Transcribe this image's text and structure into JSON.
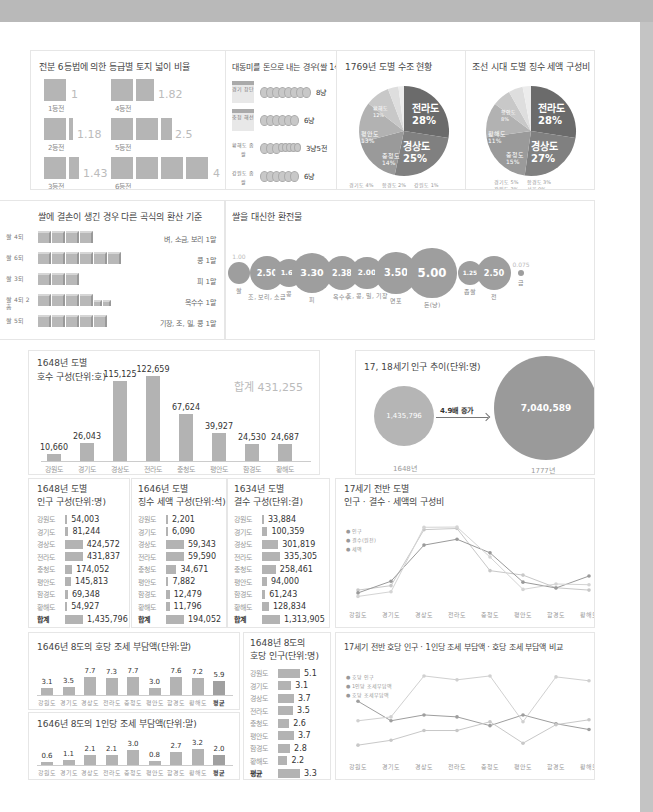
{
  "land_grades": {
    "title": "전분 6등법에 의한 등급별 토지 넓이 비율",
    "items": [
      {
        "label": "1등전",
        "value": "1"
      },
      {
        "label": "2등전",
        "value": "1.18"
      },
      {
        "label": "3등전",
        "value": "1.43"
      },
      {
        "label": "4등전",
        "value": "1.82"
      },
      {
        "label": "5등전",
        "value": "2.5"
      },
      {
        "label": "6등전",
        "value": "4"
      }
    ]
  },
  "daedong_money": {
    "title": "대동미를 돈으로 내는 경우(쌀 1석)",
    "items": [
      {
        "label": "경기 창단",
        "value": "8냥"
      },
      {
        "label": "충청 해선",
        "value": "6냥"
      },
      {
        "label": "황해도 좁쌀",
        "value": "3냥5전"
      },
      {
        "label": "강원도 좁쌀",
        "value": "6냥"
      }
    ]
  },
  "chart_data": [
    {
      "type": "bar",
      "title": "전분 6등법에 의한 등급별 토지 넓이 비율",
      "categories": [
        "1등전",
        "2등전",
        "3등전",
        "4등전",
        "5등전",
        "6등전"
      ],
      "values": [
        1,
        1.18,
        1.43,
        1.82,
        2.5,
        4
      ]
    },
    {
      "type": "bar",
      "title": "대동미를 돈으로 내는 경우(쌀 1석)",
      "categories": [
        "경기 창단",
        "충청 해선",
        "황해도 좁쌀",
        "강원도 좁쌀"
      ],
      "values": [
        8,
        6,
        3.5,
        6
      ],
      "unit": "냥"
    },
    {
      "type": "pie",
      "title": "1769년 도별 수조 현황",
      "categories": [
        "전라도",
        "경상도",
        "충청도",
        "평안도",
        "황해도",
        "경기도",
        "함경도",
        "강원도"
      ],
      "values": [
        28,
        25,
        14,
        13,
        12,
        4,
        2,
        1
      ]
    },
    {
      "type": "pie",
      "title": "조선 시대 도별 징수 세액 구성비",
      "categories": [
        "전라도",
        "경상도",
        "충청도",
        "황해도",
        "평안도",
        "경기도",
        "함경도",
        "강원도",
        "서울"
      ],
      "values": [
        28,
        27,
        15,
        11,
        8,
        5,
        3,
        3,
        0
      ]
    },
    {
      "type": "bar",
      "title": "쌀에 결손이 생긴 경우 다른 곡식의 환산 기준",
      "categories": [
        "벼, 소금, 보리 1말",
        "콩 1말",
        "피 1말",
        "옥수수 1말",
        "기장, 조, 밀, 콩 1말"
      ],
      "labels": [
        "쌀 4되",
        "쌀 6되",
        "쌀 3되",
        "쌀 4되 2홉",
        "쌀 5되"
      ],
      "values": [
        4,
        6,
        3,
        4.2,
        5
      ]
    },
    {
      "type": "scatter",
      "title": "쌀을 대신한 환전물",
      "categories": [
        "쌀",
        "조, 보리, 소금",
        "콩",
        "피",
        "옥수수",
        "조, 콩, 밀, 기장",
        "면포",
        "돈(냥)",
        "좁쌀",
        "전",
        "금"
      ],
      "values": [
        1.0,
        2.5,
        1.67,
        3.3,
        2.38,
        2.0,
        3.5,
        5.0,
        1.25,
        2.5,
        0.075
      ]
    },
    {
      "type": "bar",
      "title": "1648년 도별 호수 구성(단위:호)",
      "categories": [
        "강원도",
        "경기도",
        "경상도",
        "전라도",
        "충청도",
        "평안도",
        "함경도",
        "황해도"
      ],
      "values": [
        10660,
        26043,
        115125,
        122659,
        67624,
        39927,
        24530,
        24687
      ],
      "annotation": "합계 431,255"
    },
    {
      "type": "bubble",
      "title": "17, 18세기 인구 추이(단위:명)",
      "categories": [
        "1648년",
        "1777년"
      ],
      "values": [
        1435796,
        7040589
      ],
      "annotation": "4.9배 증가"
    },
    {
      "type": "bar",
      "title": "1648년 도별 인구 구성(단위:명)",
      "categories": [
        "강원도",
        "경기도",
        "경상도",
        "전라도",
        "충청도",
        "평안도",
        "함경도",
        "황해도",
        "합계"
      ],
      "values": [
        54003,
        81244,
        424572,
        431837,
        174052,
        145813,
        69348,
        54927,
        1435796
      ]
    },
    {
      "type": "bar",
      "title": "1646년 도별 징수 세액 구성(단위:석)",
      "categories": [
        "강원도",
        "경기도",
        "경상도",
        "전라도",
        "충청도",
        "평안도",
        "함경도",
        "황해도",
        "합계"
      ],
      "values": [
        2201,
        6090,
        59343,
        59590,
        34671,
        7882,
        12479,
        11796,
        194052
      ]
    },
    {
      "type": "bar",
      "title": "1634년 도별 결수 구성(단위:결)",
      "categories": [
        "강원도",
        "경기도",
        "경상도",
        "전라도",
        "충청도",
        "평안도",
        "함경도",
        "황해도",
        "합계"
      ],
      "values": [
        33884,
        100359,
        301819,
        335305,
        258461,
        94000,
        61243,
        128834,
        1313905
      ]
    },
    {
      "type": "line",
      "title": "17세기 전반 도별 인구·결수·세액의 구성비",
      "categories": [
        "강원도",
        "경기도",
        "경상도",
        "전라도",
        "충청도",
        "평안도",
        "함경도",
        "황해도"
      ],
      "series": [
        {
          "name": "인구",
          "values": [
            3.8,
            5.7,
            29.6,
            30.1,
            12.1,
            10.2,
            4.8,
            3.8
          ]
        },
        {
          "name": "결수(원전)",
          "values": [
            2.6,
            7.6,
            23.0,
            25.5,
            19.7,
            7.2,
            4.7,
            9.8
          ]
        },
        {
          "name": "세액",
          "values": [
            1.1,
            3.1,
            30.6,
            30.7,
            17.9,
            4.1,
            6.4,
            6.1
          ]
        }
      ]
    },
    {
      "type": "bar",
      "title": "1646년 8도의 호당 조세 부담액(단위:말)",
      "categories": [
        "강원도",
        "경기도",
        "경상도",
        "전라도",
        "충청도",
        "평안도",
        "함경도",
        "황해도",
        "평균"
      ],
      "values": [
        3.1,
        3.5,
        7.7,
        7.3,
        7.7,
        3.0,
        7.6,
        7.2,
        5.9
      ]
    },
    {
      "type": "bar",
      "title": "1646년 8도의 1인당 조세 부담액(단위:말)",
      "categories": [
        "강원도",
        "경기도",
        "경상도",
        "전라도",
        "충청도",
        "평안도",
        "함경도",
        "황해도",
        "평균"
      ],
      "values": [
        0.6,
        1.1,
        2.1,
        2.1,
        3.0,
        0.8,
        2.7,
        3.2,
        2.0
      ]
    },
    {
      "type": "bar",
      "title": "1648년 8도의 호당 인구(단위:명)",
      "categories": [
        "강원도",
        "경기도",
        "경상도",
        "전라도",
        "충청도",
        "평안도",
        "함경도",
        "황해도",
        "평균"
      ],
      "values": [
        5.1,
        3.1,
        3.7,
        3.5,
        2.6,
        3.7,
        2.8,
        2.2,
        3.3
      ]
    },
    {
      "type": "line",
      "title": "17세기 전반 호당 인구·1인당 조세 부담액·호당 조세 부담액 비교",
      "categories": [
        "강원도",
        "경기도",
        "경상도",
        "전라도",
        "충청도",
        "평안도",
        "함경도",
        "황해도"
      ],
      "series": [
        {
          "name": "호당 인구",
          "values": [
            5.1,
            3.1,
            3.7,
            3.5,
            2.6,
            3.7,
            2.8,
            2.2
          ]
        },
        {
          "name": "1인당 조세부담액",
          "values": [
            0.6,
            1.1,
            2.1,
            2.1,
            3.0,
            0.8,
            2.7,
            3.2
          ]
        },
        {
          "name": "호당 조세부담액",
          "values": [
            3.1,
            3.5,
            7.7,
            7.3,
            7.7,
            3.0,
            7.6,
            7.2
          ]
        }
      ]
    }
  ],
  "pie1769": {
    "title": "1769년 도별 수조 현황",
    "big": [
      {
        "name": "전라도",
        "pct": "28%"
      },
      {
        "name": "경상도",
        "pct": "25%"
      }
    ],
    "small": [
      {
        "name": "충청도",
        "pct": "14%"
      },
      {
        "name": "평안도",
        "pct": "13%"
      },
      {
        "name": "황해도",
        "pct": "12%"
      }
    ],
    "legend": [
      "경기도 4%",
      "함경도 2%",
      "강원도 1%"
    ]
  },
  "pieTax": {
    "title": "조선 시대 도별 징수 세액 구성비",
    "big": [
      {
        "name": "전라도",
        "pct": "28%"
      },
      {
        "name": "경상도",
        "pct": "27%"
      }
    ],
    "small": [
      {
        "name": "충청도",
        "pct": "15%"
      },
      {
        "name": "황해도",
        "pct": "11%"
      },
      {
        "name": "평안도",
        "pct": "8%"
      }
    ],
    "legend": [
      "경기도 5%",
      "함경도 3%",
      "강원도 3%",
      "서울 0%"
    ]
  },
  "grain": {
    "title": "쌀에 결손이 생긴 경우 다른 곡식의 환산 기준",
    "rows": [
      {
        "rice": "쌀 4되",
        "boxes": 4,
        "half": 0,
        "item": "벼, 소금, 보리 1말"
      },
      {
        "rice": "쌀 6되",
        "boxes": 6,
        "half": 0,
        "item": "콩 1말"
      },
      {
        "rice": "쌀 3되",
        "boxes": 3,
        "half": 0,
        "item": "피 1말"
      },
      {
        "rice": "쌀 4되 2홉",
        "boxes": 4,
        "half": 2,
        "item": "옥수수 1말"
      },
      {
        "rice": "쌀 5되",
        "boxes": 5,
        "half": 0,
        "item": "기장, 조, 밀, 콩 1말"
      }
    ]
  },
  "exchange": {
    "title": "쌀을 대신한 환전물",
    "items": [
      {
        "v": "1.00",
        "label": "쌀"
      },
      {
        "v": "2.50",
        "label": "조, 보리, 소금"
      },
      {
        "v": "1.67",
        "label": "콩"
      },
      {
        "v": "3.30",
        "label": "피"
      },
      {
        "v": "2.38",
        "label": "옥수수"
      },
      {
        "v": "2.00",
        "label": "조, 콩, 밀, 기장"
      },
      {
        "v": "3.50",
        "label": "면포"
      },
      {
        "v": "5.00",
        "label": "돈(냥)"
      },
      {
        "v": "1.25",
        "label": "좁쌀"
      },
      {
        "v": "2.50",
        "label": "전"
      },
      {
        "v": "0.075",
        "label": "금"
      }
    ]
  },
  "households": {
    "title1": "1648년 도별",
    "title2": "호수 구성(단위:호)",
    "total": "합계 431,255",
    "labels": [
      "10,660",
      "26,043",
      "115,125",
      "122,659",
      "67,624",
      "39,927",
      "24,530",
      "24,687"
    ],
    "cats": [
      "강원도",
      "경기도",
      "경상도",
      "전라도",
      "충청도",
      "평안도",
      "함경도",
      "황해도"
    ]
  },
  "popTrend": {
    "title": "17, 18세기 인구 추이(단위:명)",
    "v1": "1,435,796",
    "y1": "1648년",
    "v2": "7,040,589",
    "y2": "1777년",
    "arrow": "4.9배 증가"
  },
  "popTable": {
    "title1": "1648년 도별",
    "title2": "인구 구성(단위:명)",
    "rows": [
      [
        "강원도",
        "54,003"
      ],
      [
        "경기도",
        "81,244"
      ],
      [
        "경상도",
        "424,572"
      ],
      [
        "전라도",
        "431,837"
      ],
      [
        "충청도",
        "174,052"
      ],
      [
        "평안도",
        "145,813"
      ],
      [
        "함경도",
        "69,348"
      ],
      [
        "황해도",
        "54,927"
      ],
      [
        "합계",
        "1,435,796"
      ]
    ]
  },
  "taxTable": {
    "title1": "1646년 도별",
    "title2": "징수 세액 구성(단위:석)",
    "rows": [
      [
        "강원도",
        "2,201"
      ],
      [
        "경기도",
        "6,090"
      ],
      [
        "경상도",
        "59,343"
      ],
      [
        "전라도",
        "59,590"
      ],
      [
        "충청도",
        "34,671"
      ],
      [
        "평안도",
        "7,882"
      ],
      [
        "함경도",
        "12,479"
      ],
      [
        "황해도",
        "11,796"
      ],
      [
        "합계",
        "194,052"
      ]
    ]
  },
  "landTable": {
    "title1": "1634년 도별",
    "title2": "결수 구성(단위:결)",
    "rows": [
      [
        "강원도",
        "33,884"
      ],
      [
        "경기도",
        "100,359"
      ],
      [
        "경상도",
        "301,819"
      ],
      [
        "전라도",
        "335,305"
      ],
      [
        "충청도",
        "258,461"
      ],
      [
        "평안도",
        "94,000"
      ],
      [
        "함경도",
        "61,243"
      ],
      [
        "황해도",
        "128,834"
      ],
      [
        "합계",
        "1,313,905"
      ]
    ]
  },
  "ratioLine": {
    "title1": "17세기 전반 도별",
    "title2": "인구 · 결수 · 세액의 구성비",
    "legend": [
      "인구",
      "결수(원전)",
      "세액"
    ],
    "cats": [
      "강원도",
      "경기도",
      "경상도",
      "전라도",
      "충청도",
      "평안도",
      "함경도",
      "황해도"
    ]
  },
  "hhTax": {
    "title": "1646년 8도의 호당 조세 부담액(단위:말)",
    "vals": [
      "3.1",
      "3.5",
      "7.7",
      "7.3",
      "7.7",
      "3.0",
      "7.6",
      "7.2",
      "5.9"
    ],
    "cats": [
      "강원도",
      "경기도",
      "경상도",
      "전라도",
      "충청도",
      "평안도",
      "함경도",
      "황해도",
      "평균"
    ]
  },
  "pcTax": {
    "title": "1646년 8도의 1인당 조세 부담액(단위:말)",
    "vals": [
      "0.6",
      "1.1",
      "2.1",
      "2.1",
      "3.0",
      "0.8",
      "2.7",
      "3.2",
      "2.0"
    ],
    "cats": [
      "강원도",
      "경기도",
      "경상도",
      "전라도",
      "충청도",
      "평안도",
      "함경도",
      "황해도",
      "평균"
    ]
  },
  "hhPop": {
    "title1": "1648년 8도의",
    "title2": "호당 인구(단위:명)",
    "rows": [
      [
        "강원도",
        "5.1"
      ],
      [
        "경기도",
        "3.1"
      ],
      [
        "경상도",
        "3.7"
      ],
      [
        "전라도",
        "3.5"
      ],
      [
        "충청도",
        "2.6"
      ],
      [
        "평안도",
        "3.7"
      ],
      [
        "함경도",
        "2.8"
      ],
      [
        "황해도",
        "2.2"
      ],
      [
        "평균",
        "3.3"
      ]
    ]
  },
  "compLine": {
    "title": "17세기 전반 호당 인구 · 1인당 조세 부담액 · 호당 조세 부담액 비교",
    "legend": [
      "호당 인구",
      "1인당 조세부담액",
      "호당 조세부담액"
    ],
    "cats": [
      "강원도",
      "경기도",
      "경상도",
      "전라도",
      "충청도",
      "평안도",
      "함경도",
      "황해도"
    ]
  }
}
